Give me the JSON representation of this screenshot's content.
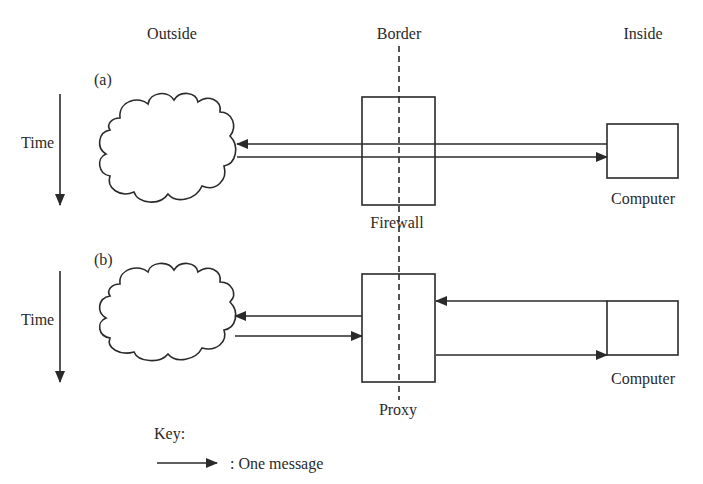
{
  "columns": {
    "outside": "Outside",
    "border": "Border",
    "inside": "Inside"
  },
  "panels": [
    {
      "id": "a",
      "label": "(a)",
      "time_label": "Time",
      "middle_box_label": "Firewall",
      "inside_box_label": "Computer",
      "messages": [
        {
          "from": "Computer",
          "to": "Outside",
          "through": "Firewall"
        },
        {
          "from": "Outside",
          "to": "Computer",
          "through": "Firewall"
        }
      ]
    },
    {
      "id": "b",
      "label": "(b)",
      "time_label": "Time",
      "middle_box_label": "Proxy",
      "inside_box_label": "Computer",
      "messages": [
        {
          "from": "Computer",
          "to": "Proxy"
        },
        {
          "from": "Proxy",
          "to": "Outside"
        },
        {
          "from": "Outside",
          "to": "Proxy"
        },
        {
          "from": "Proxy",
          "to": "Computer"
        }
      ]
    }
  ],
  "key": {
    "title": "Key:",
    "entry": ":  One message"
  },
  "colors": {
    "stroke": "#2a2a2a",
    "background": "#ffffff"
  }
}
